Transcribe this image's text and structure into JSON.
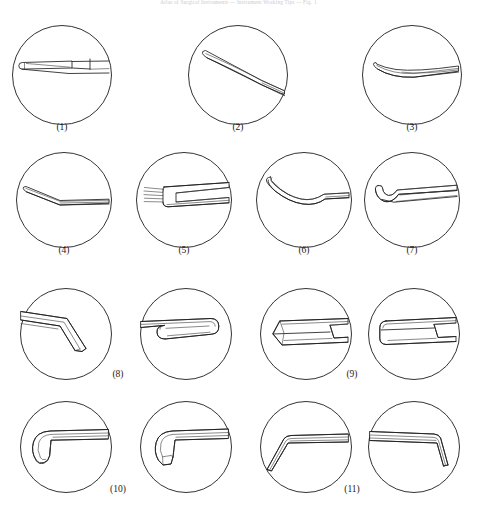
{
  "header": {
    "running_text": "Atlas of Surgical Instruments  —  Instrument Working Tips  —  Fig. 1"
  },
  "figure": {
    "kind": "instrument-tip-plate",
    "total_panels": 15,
    "label_count": 11,
    "rows": [
      {
        "row_index": 1,
        "panels": [
          {
            "id": "p1",
            "label": "(1)",
            "cx": 62,
            "cy": 75,
            "r": 50,
            "tip_type": "flat-blade-elevator",
            "shaft_angle_deg": 0
          },
          {
            "id": "p2",
            "label": "(2)",
            "cx": 238,
            "cy": 75,
            "r": 50,
            "tip_type": "long-curved-tapered-blade",
            "shaft_angle_deg": 0
          },
          {
            "id": "p3",
            "label": "(3)",
            "cx": 412,
            "cy": 75,
            "r": 50,
            "tip_type": "slender-upcurved-blade",
            "shaft_angle_deg": 0
          }
        ]
      },
      {
        "row_index": 2,
        "panels": [
          {
            "id": "p4",
            "label": "(4)",
            "cx": 64,
            "cy": 200,
            "r": 48,
            "tip_type": "angled-bent-blade",
            "shaft_angle_deg": 0
          },
          {
            "id": "p5",
            "label": "(5)",
            "cx": 184,
            "cy": 200,
            "r": 48,
            "tip_type": "multi-prong-rake-retractor",
            "prong_count": 4
          },
          {
            "id": "p6",
            "label": "(6)",
            "cx": 304,
            "cy": 200,
            "r": 48,
            "tip_type": "s-curved-spoon-elevator"
          },
          {
            "id": "p7",
            "label": "(7)",
            "cx": 412,
            "cy": 200,
            "r": 48,
            "tip_type": "hooked-recurved-tip"
          }
        ]
      },
      {
        "row_index": 3,
        "panels": [
          {
            "id": "p8a",
            "label": "(8)",
            "label_shared": true,
            "cx": 66,
            "cy": 334,
            "r": 46,
            "tip_type": "bayonet-angled-chisel"
          },
          {
            "id": "p8b",
            "label": "",
            "cx": 186,
            "cy": 334,
            "r": 46,
            "tip_type": "rounded-end-gouge"
          },
          {
            "id": "p9a",
            "label": "(9)",
            "label_shared": true,
            "cx": 306,
            "cy": 334,
            "r": 46,
            "tip_type": "beveled-flat-osteotome"
          },
          {
            "id": "p9b",
            "label": "",
            "cx": 414,
            "cy": 334,
            "r": 46,
            "tip_type": "round-nose-osteotome"
          }
        ]
      },
      {
        "row_index": 4,
        "panels": [
          {
            "id": "p10a",
            "label": "(10)",
            "label_shared": true,
            "cx": 66,
            "cy": 447,
            "r": 46,
            "tip_type": "curved-down-rounded-rasp"
          },
          {
            "id": "p10b",
            "label": "",
            "cx": 186,
            "cy": 447,
            "r": 46,
            "tip_type": "curved-down-angled-rasp"
          },
          {
            "id": "p11a",
            "label": "(11)",
            "label_shared": true,
            "cx": 306,
            "cy": 447,
            "r": 46,
            "tip_type": "left-bent-flat-blade"
          },
          {
            "id": "p11b",
            "label": "",
            "cx": 414,
            "cy": 447,
            "r": 46,
            "tip_type": "right-bent-pointed-blade"
          }
        ]
      }
    ],
    "labels": [
      {
        "text": "(1)",
        "x": 62,
        "y": 128
      },
      {
        "text": "(2)",
        "x": 238,
        "y": 128
      },
      {
        "text": "(3)",
        "x": 412,
        "y": 128
      },
      {
        "text": "(4)",
        "x": 64,
        "y": 251
      },
      {
        "text": "(5)",
        "x": 184,
        "y": 251
      },
      {
        "text": "(6)",
        "x": 304,
        "y": 251
      },
      {
        "text": "(7)",
        "x": 412,
        "y": 251
      },
      {
        "text": "(8)",
        "x": 118,
        "y": 375
      },
      {
        "text": "(9)",
        "x": 352,
        "y": 375
      },
      {
        "text": "(10)",
        "x": 118,
        "y": 490
      },
      {
        "text": "(11)",
        "x": 352,
        "y": 490
      }
    ]
  },
  "style": {
    "background": "#ffffff",
    "ink": "#1f1f1f",
    "circle_stroke": "#1c1c1c",
    "detail_stroke": "#3a3a3a",
    "header_text_color": "#c9c9d2"
  }
}
